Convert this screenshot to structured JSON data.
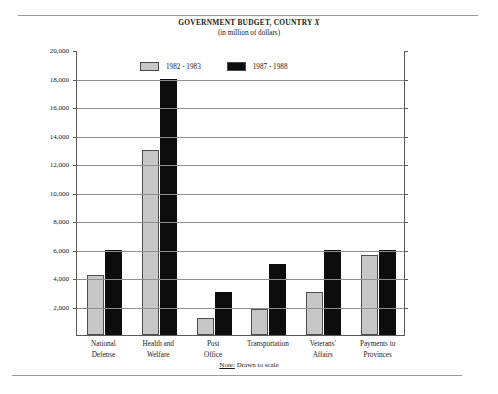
{
  "page": {
    "note_lead": "Note:",
    "note_text": " Drawn to scale"
  },
  "chart_data": {
    "type": "bar",
    "title": "GOVERNMENT BUDGET, COUNTRY X",
    "title_prefix": "GOVERNMENT BUDGET, COUNTRY ",
    "title_variable": "X",
    "subtitle": "(in million of dollars)",
    "xlabel": "",
    "ylabel": "",
    "ylim": [
      0,
      20000
    ],
    "ytick_step": 2000,
    "grid": true,
    "legend_position": "top-center",
    "categories": [
      "National Defense",
      "Health and Welfare",
      "Post Office",
      "Transportation",
      "Veterans' Affairs",
      "Payments to Provinces"
    ],
    "category_lines": [
      [
        "National",
        "Defense"
      ],
      [
        "Health and",
        "Welfare"
      ],
      [
        "Post",
        "Office"
      ],
      [
        "Transportation",
        ""
      ],
      [
        "Veterans'",
        "Affairs"
      ],
      [
        "Payments to",
        "Provinces"
      ]
    ],
    "ytick_labels": [
      "2,000",
      "4,000",
      "6,000",
      "8,000",
      "10,000",
      "12,000",
      "14,000",
      "16,000",
      "18,000",
      "20,000"
    ],
    "ytick_values": [
      2000,
      4000,
      6000,
      8000,
      10000,
      12000,
      14000,
      16000,
      18000,
      20000
    ],
    "series": [
      {
        "name": "1982 - 1983",
        "color": "#c7c7c7",
        "values": [
          4200,
          13000,
          1200,
          1800,
          3000,
          5600
        ]
      },
      {
        "name": "1987 - 1988",
        "color": "#0d0d0d",
        "values": [
          6000,
          18000,
          3000,
          5000,
          6000,
          6000
        ]
      }
    ]
  }
}
